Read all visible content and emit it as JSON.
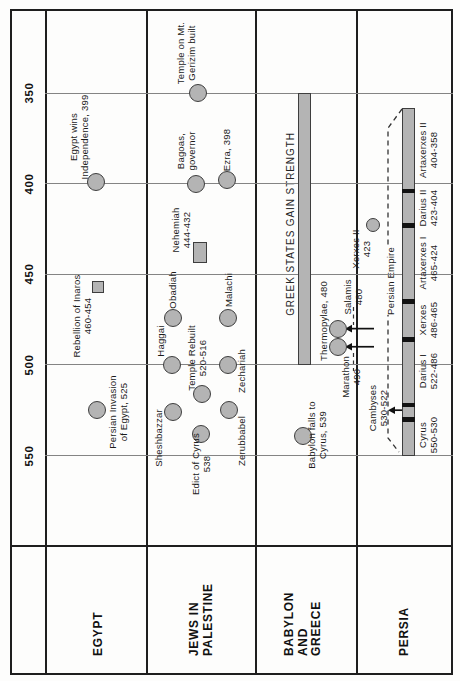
{
  "chart_data": {
    "type": "timeline",
    "era": "BC",
    "orientation": "rotated 90deg CCW: time axis vertical, 350 BC at top, 550 BC at bottom; category rows are columns, row labels at bottom",
    "time_axis": {
      "ticks": [
        350,
        400,
        450,
        500,
        550
      ],
      "visible_range": [
        558,
        304
      ]
    },
    "greek_bar": {
      "label": "GREEK STATES GAIN STRENGTH",
      "from": 500,
      "to": 350
    },
    "persian_empire_label": "Persian Empire",
    "persian_kings_bar": {
      "from": 550,
      "to": 358
    },
    "persian_king_dividers": [
      530,
      522,
      486,
      465,
      423,
      404
    ],
    "persian_kings": [
      {
        "name": "Cyrus",
        "years": "550-530",
        "label_x": 428,
        "label_y": 435
      },
      {
        "name": "Cambyses",
        "years": "530-522",
        "label_x": 378,
        "label_y": 408
      },
      {
        "name": "Darius I",
        "years": "522-486",
        "label_x": 428,
        "label_y": 371
      },
      {
        "name": "Xerxes",
        "years": "486-465",
        "label_x": 428,
        "label_y": 320
      },
      {
        "name": "Artaxerxes I",
        "years": "465-424",
        "label_x": 428,
        "label_y": 263
      },
      {
        "name": "Xerxes II",
        "years": "423",
        "label_x": 361,
        "label_y": 249,
        "marker": "circle-sm",
        "marker_x": 373,
        "marker_year": 423
      },
      {
        "name": "Darius II",
        "years": "423-404",
        "label_x": 428,
        "label_y": 208
      },
      {
        "name": "Artaxerxes II",
        "years": "404-358",
        "label_x": 428,
        "label_y": 150
      }
    ],
    "invasion_arrows": [
      {
        "target": "Thermopylae / Salamis",
        "year": 480,
        "x_from": 374,
        "x_to": 345
      },
      {
        "target": "Marathon",
        "year": 490,
        "x_from": 374,
        "x_to": 345
      },
      {
        "target": "Egypt (Cambyses)",
        "year": 525,
        "x_from": 402,
        "x_to": 388
      }
    ],
    "rows": [
      {
        "label_lines": [
          "EGYPT"
        ],
        "label_x": 99,
        "events": [
          {
            "lines": [
              "Egypt wins",
              "Independence, 399"
            ],
            "year": 399,
            "marker": "circle",
            "cx": 96,
            "lx": 79,
            "ly": 137
          },
          {
            "lines": [
              "Rebellion of Inaros",
              "460-454"
            ],
            "start": 460,
            "end": 454,
            "marker": "square",
            "cx": 98,
            "lx": 82,
            "ly": 316
          },
          {
            "lines": [
              "Persian Invasion",
              "of Egypt, 525"
            ],
            "year": 525,
            "marker": "circle",
            "cx": 97,
            "lx": 118,
            "ly": 412
          }
        ]
      },
      {
        "label_lines": [
          "JEWS IN",
          "PALESTINE"
        ],
        "label_x": 201,
        "events": [
          {
            "lines": [
              "Temple on Mt.",
              "Gerizim built"
            ],
            "year": 350,
            "marker": "circle",
            "cx": 198,
            "lx": 186,
            "ly": 53
          },
          {
            "lines": [
              "Bagoas,",
              "governor"
            ],
            "year": 400,
            "marker": "circle",
            "cx": 196,
            "lx": 186,
            "ly": 151
          },
          {
            "lines": [
              "Ezra, 398"
            ],
            "year": 398,
            "marker": "circle",
            "cx": 227,
            "lx": 227,
            "ly": 150
          },
          {
            "lines": [
              "Nehemiah",
              "444-432"
            ],
            "start": 444,
            "end": 432,
            "marker": "bar",
            "cx": 200,
            "lx": 181,
            "ly": 230
          },
          {
            "lines": [
              "Obadiah"
            ],
            "year": 474,
            "marker": "circle",
            "cx": 173,
            "lx": 173,
            "ly": 290
          },
          {
            "lines": [
              "Malachi"
            ],
            "year": 474,
            "marker": "circle",
            "cx": 228,
            "lx": 229,
            "ly": 290
          },
          {
            "lines": [
              "Haggai"
            ],
            "year": 500,
            "marker": "circle",
            "cx": 172,
            "lx": 161,
            "ly": 341
          },
          {
            "lines": [
              "Zechariah"
            ],
            "year": 500,
            "marker": "circle",
            "cx": 228,
            "lx": 242,
            "ly": 371
          },
          {
            "lines": [
              "Temple Rebuilt",
              "520-516"
            ],
            "year": 516,
            "marker": "circle",
            "cx": 202,
            "lx": 197,
            "ly": 358
          },
          {
            "lines": [
              "Sheshbazzar"
            ],
            "year": 526,
            "marker": "circle",
            "cx": 173,
            "lx": 159,
            "ly": 438
          },
          {
            "lines": [
              "Zerubbabel"
            ],
            "year": 525,
            "marker": "circle",
            "cx": 229,
            "lx": 242,
            "ly": 441
          },
          {
            "lines": [
              "Edict of Cyrus",
              "538"
            ],
            "year": 538,
            "marker": "circle",
            "cx": 201,
            "lx": 201,
            "ly": 464
          }
        ]
      },
      {
        "label_lines": [
          "BABYLON",
          "AND",
          "GREECE"
        ],
        "label_x": 303,
        "events": [
          {
            "lines": [
              "Thermopylae, 480"
            ],
            "year": 480,
            "marker": "circle",
            "cx": 338,
            "lx": 324,
            "ly": 321
          },
          {
            "lines": [
              "Salamis",
              "480"
            ],
            "marker": "none",
            "lx": 353,
            "ly": 297
          },
          {
            "lines": [
              "Marathon",
              "490"
            ],
            "year": 490,
            "marker": "circle",
            "cx": 338,
            "lx": 351,
            "ly": 377
          },
          {
            "lines": [
              "Babylon falls to",
              "Cyrus, 539"
            ],
            "year": 539,
            "marker": "circle",
            "cx": 303,
            "lx": 317,
            "ly": 435
          }
        ]
      },
      {
        "label_lines": [
          "PERSIA"
        ],
        "label_x": 405,
        "events": []
      }
    ]
  }
}
